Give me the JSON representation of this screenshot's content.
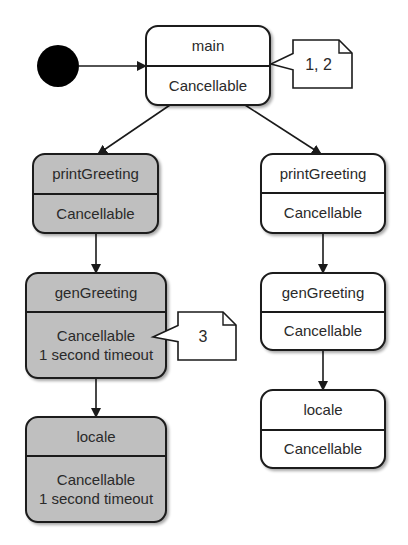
{
  "colors": {
    "active_fill": "#bfbfbf",
    "inactive_fill": "#ffffff",
    "stroke": "#1a1a1a",
    "initial_node": "#000000",
    "note_fill": "#ffffff"
  },
  "initial_node": {
    "cx": 58,
    "cy": 66,
    "r": 21
  },
  "states": [
    {
      "id": "main",
      "name": "main",
      "body": [
        "Cancellable"
      ],
      "active": false,
      "x": 146,
      "y": 26,
      "w": 124,
      "h": 79,
      "divider": 66
    },
    {
      "id": "printGreeting-left",
      "name": "printGreeting",
      "body": [
        "Cancellable"
      ],
      "active": true,
      "x": 33,
      "y": 154,
      "w": 125,
      "h": 79,
      "divider": 194
    },
    {
      "id": "genGreeting-left",
      "name": "genGreeting",
      "body": [
        "Cancellable",
        "1 second timeout"
      ],
      "active": true,
      "x": 26,
      "y": 273,
      "w": 140,
      "h": 105,
      "divider": 312
    },
    {
      "id": "locale-left",
      "name": "locale",
      "body": [
        "Cancellable",
        "1 second timeout"
      ],
      "active": true,
      "x": 26,
      "y": 417,
      "w": 140,
      "h": 105,
      "divider": 456
    },
    {
      "id": "printGreeting-right",
      "name": "printGreeting",
      "body": [
        "Cancellable"
      ],
      "active": false,
      "x": 261,
      "y": 154,
      "w": 124,
      "h": 79,
      "divider": 193
    },
    {
      "id": "genGreeting-right",
      "name": "genGreeting",
      "body": [
        "Cancellable"
      ],
      "active": false,
      "x": 261,
      "y": 273,
      "w": 124,
      "h": 77,
      "divider": 312
    },
    {
      "id": "locale-right",
      "name": "locale",
      "body": [
        "Cancellable"
      ],
      "active": false,
      "x": 261,
      "y": 390,
      "w": 124,
      "h": 78,
      "divider": 430
    }
  ],
  "transitions": [
    {
      "from": "initial",
      "to": "main",
      "x1": 79,
      "y1": 66,
      "x2": 146,
      "y2": 66
    },
    {
      "from": "main",
      "to": "printGreeting-left",
      "x1": 170,
      "y1": 105,
      "x2": 98,
      "y2": 154
    },
    {
      "from": "main",
      "to": "printGreeting-right",
      "x1": 245,
      "y1": 105,
      "x2": 321,
      "y2": 154
    },
    {
      "from": "printGreeting-left",
      "to": "genGreeting-left",
      "x1": 96,
      "y1": 233,
      "x2": 96,
      "y2": 273
    },
    {
      "from": "genGreeting-left",
      "to": "locale-left",
      "x1": 96,
      "y1": 378,
      "x2": 96,
      "y2": 417
    },
    {
      "from": "printGreeting-right",
      "to": "genGreeting-right",
      "x1": 323,
      "y1": 233,
      "x2": 323,
      "y2": 273
    },
    {
      "from": "genGreeting-right",
      "to": "locale-right",
      "x1": 323,
      "y1": 350,
      "x2": 323,
      "y2": 390
    }
  ],
  "notes": [
    {
      "id": "note-main",
      "text": "1, 2",
      "x": 293,
      "y": 40,
      "w": 59,
      "h": 48,
      "fold": 13,
      "tip_x": 271,
      "tip_y": 64
    },
    {
      "id": "note-genGreeting",
      "text": "3",
      "x": 178,
      "y": 312,
      "w": 58,
      "h": 48,
      "fold": 13,
      "tip_x": 153,
      "tip_y": 337
    }
  ]
}
